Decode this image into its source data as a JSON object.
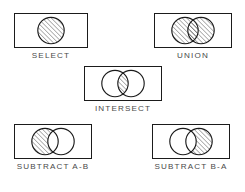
{
  "figure": {
    "kind": "boolean-set-operations-reference",
    "background_color": "#ffffff",
    "stroke_color": "#1b1b1b",
    "hatch_color": "#3a3a3a",
    "label_color": "#4a4a4a"
  },
  "panels": [
    {
      "id": "select",
      "label": "SELECT",
      "circles": 1,
      "shaded_region": "whole-circle-a",
      "description": "A single circle entirely filled with diagonal hatching."
    },
    {
      "id": "union",
      "label": "UNION",
      "circles": 2,
      "shaded_region": "a-union-b",
      "description": "Two overlapping circles, both entirely filled with diagonal hatching."
    },
    {
      "id": "intersect",
      "label": "INTERSECT",
      "circles": 2,
      "shaded_region": "a-intersect-b",
      "description": "Two overlapping circles with only the lens-shaped overlap hatched."
    },
    {
      "id": "subtract-a-b",
      "label": "SUBTRACT A-B",
      "circles": 2,
      "shaded_region": "a-minus-b",
      "description": "Left circle hatched excluding the overlap; right circle empty."
    },
    {
      "id": "subtract-b-a",
      "label": "SUBTRACT B-A",
      "circles": 2,
      "shaded_region": "b-minus-a",
      "description": "Right circle hatched excluding the overlap; left circle empty."
    }
  ]
}
